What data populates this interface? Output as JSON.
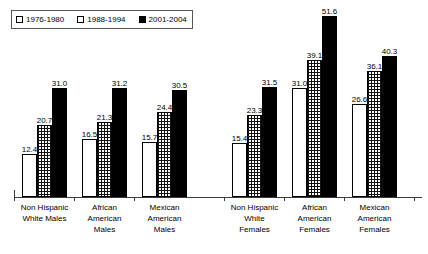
{
  "chart_data": {
    "type": "bar",
    "title": "",
    "subtitle": "",
    "xlabel": "",
    "ylabel": "",
    "ylim": [
      0,
      56
    ],
    "grid": false,
    "legend_position": "top-left",
    "legend_box": true,
    "categories": [
      "Non Hispanic White Males",
      "African American Males",
      "Mexican American Males",
      "Non Hispanic White Females",
      "African American Females",
      "Mexican American Females"
    ],
    "category_lines": [
      [
        "Non Hispanic",
        "White Males"
      ],
      [
        "African",
        "American",
        "Males"
      ],
      [
        "Mexican",
        "American",
        "Males"
      ],
      [
        "Non Hispanic",
        "White",
        "Females"
      ],
      [
        "African",
        "American",
        "Females"
      ],
      [
        "Mexican",
        "American",
        "Females"
      ]
    ],
    "series": [
      {
        "name": "1976-1980",
        "fill": "open",
        "color": "#ffffff",
        "values": [
          12.4,
          16.5,
          15.7,
          15.4,
          31.0,
          26.6
        ]
      },
      {
        "name": "1988-1994",
        "fill": "dotted",
        "color": "#cccccc",
        "values": [
          20.7,
          21.3,
          24.4,
          23.3,
          39.1,
          36.1
        ]
      },
      {
        "name": "2001-2004",
        "fill": "solid",
        "color": "#000000",
        "values": [
          31.0,
          31.2,
          30.5,
          31.5,
          51.6,
          40.3
        ]
      }
    ]
  },
  "legend": {
    "items": [
      {
        "label": "1976-1980",
        "swatch": "open-square-icon"
      },
      {
        "label": "1988-1994",
        "swatch": "dotted-square-icon"
      },
      {
        "label": "2001-2004",
        "swatch": "filled-square-icon"
      }
    ]
  },
  "axis": {
    "baseline_color": "#3a3a3a"
  }
}
